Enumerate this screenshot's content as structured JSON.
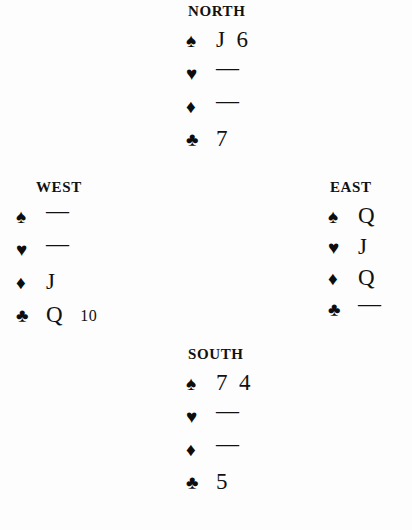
{
  "diagram": {
    "type": "bridge-hand-diagram",
    "suit_symbols": {
      "spade": "♠",
      "heart": "♥",
      "diamond": "♦",
      "club": "♣"
    },
    "void_marker": "—",
    "ink_color": "#111111",
    "background_color": "#fdfdfd"
  },
  "hands": {
    "north": {
      "label": "NORTH",
      "spades": {
        "symbol": "♠",
        "cards": [
          "J",
          "6"
        ]
      },
      "hearts": {
        "symbol": "♥",
        "cards": [
          "—"
        ]
      },
      "diamonds": {
        "symbol": "♦",
        "cards": [
          "—"
        ]
      },
      "clubs": {
        "symbol": "♣",
        "cards": [
          "7"
        ]
      }
    },
    "west": {
      "label": "WEST",
      "spades": {
        "symbol": "♠",
        "cards": [
          "—"
        ]
      },
      "hearts": {
        "symbol": "♥",
        "cards": [
          "—"
        ]
      },
      "diamonds": {
        "symbol": "♦",
        "cards": [
          "J"
        ]
      },
      "clubs": {
        "symbol": "♣",
        "cards": [
          "Q",
          "10"
        ]
      }
    },
    "east": {
      "label": "EAST",
      "spades": {
        "symbol": "♠",
        "cards": [
          "Q"
        ]
      },
      "hearts": {
        "symbol": "♥",
        "cards": [
          "J"
        ]
      },
      "diamonds": {
        "symbol": "♦",
        "cards": [
          "Q"
        ]
      },
      "clubs": {
        "symbol": "♣",
        "cards": [
          "—"
        ]
      }
    },
    "south": {
      "label": "SOUTH",
      "spades": {
        "symbol": "♠",
        "cards": [
          "7",
          "4"
        ]
      },
      "hearts": {
        "symbol": "♥",
        "cards": [
          "—"
        ]
      },
      "diamonds": {
        "symbol": "♦",
        "cards": [
          "—"
        ]
      },
      "clubs": {
        "symbol": "♣",
        "cards": [
          "5"
        ]
      }
    }
  }
}
